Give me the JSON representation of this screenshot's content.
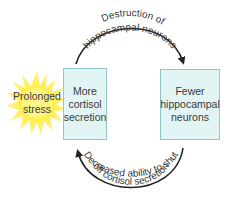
{
  "diagram": {
    "stressor": {
      "label_lines": [
        "Prolonged",
        "stress"
      ],
      "icon": "starburst-icon",
      "color": "#fff200"
    },
    "nodes": [
      {
        "id": "cortisol",
        "label_lines": [
          "More",
          "cortisol",
          "secretion"
        ]
      },
      {
        "id": "neurons",
        "label_lines": [
          "Fewer",
          "hippocampal",
          "neurons"
        ]
      }
    ],
    "edges": [
      {
        "from": "cortisol",
        "to": "neurons",
        "label_lines": [
          "Destruction of",
          "hippocampal neurons"
        ]
      },
      {
        "from": "neurons",
        "to": "cortisol",
        "label_lines": [
          "Decreased ability to shut",
          "off cortisol secretion"
        ]
      }
    ],
    "colors": {
      "box_fill": "#e3f4f4",
      "box_border": "#8fc8c8",
      "arrow": "#222222",
      "text": "#3a3a3a"
    }
  }
}
